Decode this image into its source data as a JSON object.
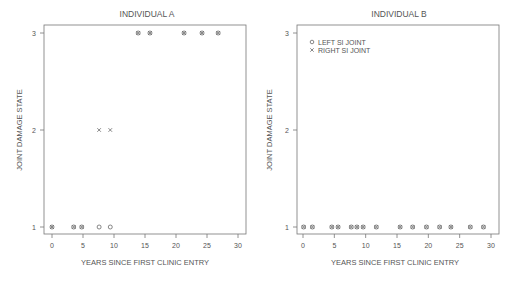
{
  "chart_data": [
    {
      "type": "scatter",
      "title": "INDIVIDUAL  A",
      "xlabel": "YEARS  SINCE  FIRST  CLINIC  ENTRY",
      "ylabel": "JOINT  DAMAGE  STATE",
      "xlim": [
        0,
        30
      ],
      "ylim": [
        1,
        3
      ],
      "xticks": [
        0,
        5,
        10,
        15,
        20,
        25,
        30
      ],
      "yticks": [
        1,
        2,
        3
      ],
      "grid": false,
      "legend": null,
      "series": [
        {
          "name": "LEFT SI JOINT",
          "marker": "circle",
          "points": [
            [
              0,
              1
            ],
            [
              3.5,
              1
            ],
            [
              4.8,
              1
            ],
            [
              7.6,
              1
            ],
            [
              9.4,
              1
            ],
            [
              13.9,
              3
            ],
            [
              15.8,
              3
            ],
            [
              21.3,
              3
            ],
            [
              24.2,
              3
            ],
            [
              26.8,
              3
            ]
          ]
        },
        {
          "name": "RIGHT SI JOINT",
          "marker": "x",
          "points": [
            [
              0,
              1
            ],
            [
              3.5,
              1
            ],
            [
              4.8,
              1
            ],
            [
              7.6,
              2
            ],
            [
              9.4,
              2
            ],
            [
              13.9,
              3
            ],
            [
              15.8,
              3
            ],
            [
              21.3,
              3
            ],
            [
              24.2,
              3
            ],
            [
              26.8,
              3
            ]
          ]
        }
      ]
    },
    {
      "type": "scatter",
      "title": "INDIVIDUAL  B",
      "xlabel": "YEARS  SINCE  FIRST  CLINIC  ENTRY",
      "ylabel": "JOINT  DAMAGE  STATE",
      "xlim": [
        0,
        30
      ],
      "ylim": [
        1,
        3
      ],
      "xticks": [
        0,
        5,
        10,
        15,
        20,
        25,
        30
      ],
      "yticks": [
        1,
        2,
        3
      ],
      "grid": false,
      "legend": {
        "position": "top-left",
        "entries": [
          "LEFT SI JOINT",
          "RIGHT SI JOINT"
        ]
      },
      "series": [
        {
          "name": "LEFT SI JOINT",
          "marker": "circle",
          "points": [
            [
              0.1,
              1
            ],
            [
              1.5,
              1
            ],
            [
              4.6,
              1
            ],
            [
              5.6,
              1
            ],
            [
              7.7,
              1
            ],
            [
              8.6,
              1
            ],
            [
              9.6,
              1
            ],
            [
              11.7,
              1
            ],
            [
              15.5,
              1
            ],
            [
              17.5,
              1
            ],
            [
              19.7,
              1
            ],
            [
              21.8,
              1
            ],
            [
              23.6,
              1
            ],
            [
              26.7,
              1
            ],
            [
              28.8,
              1
            ]
          ]
        },
        {
          "name": "RIGHT SI JOINT",
          "marker": "x",
          "points": [
            [
              0.1,
              1
            ],
            [
              1.5,
              1
            ],
            [
              4.6,
              1
            ],
            [
              5.6,
              1
            ],
            [
              7.7,
              1
            ],
            [
              8.6,
              1
            ],
            [
              9.6,
              1
            ],
            [
              11.7,
              1
            ],
            [
              15.5,
              1
            ],
            [
              17.5,
              1
            ],
            [
              19.7,
              1
            ],
            [
              21.8,
              1
            ],
            [
              23.6,
              1
            ],
            [
              26.7,
              1
            ],
            [
              28.8,
              1
            ]
          ]
        }
      ]
    }
  ],
  "plots": {
    "a": {
      "title": "INDIVIDUAL  A",
      "xlabel": "YEARS  SINCE  FIRST  CLINIC  ENTRY",
      "ylabel": "JOINT  DAMAGE  STATE"
    },
    "b": {
      "title": "INDIVIDUAL  B",
      "xlabel": "YEARS  SINCE  FIRST  CLINIC  ENTRY",
      "ylabel": "JOINT  DAMAGE  STATE",
      "legend_left": "LEFT SI JOINT",
      "legend_right": "RIGHT SI JOINT"
    }
  },
  "colors": {
    "axis": "#777777",
    "marker": "#555555",
    "text": "#555555"
  }
}
